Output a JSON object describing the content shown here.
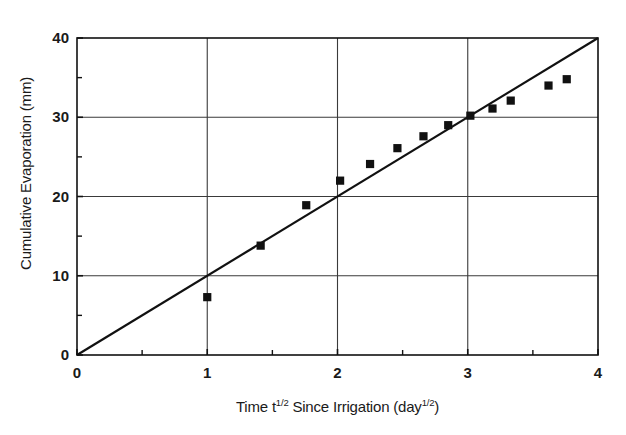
{
  "chart_data": {
    "type": "scatter",
    "title": "",
    "xlabel": "Time t^1/2 Since Irrigation (day^1/2)",
    "xlabel_parts": {
      "pre": "Time t",
      "sup1": "1/2",
      "mid": " Since Irrigation (day",
      "sup2": "1/2",
      "post": ")"
    },
    "ylabel": "Cumulative Evaporation (mm)",
    "xlim": [
      0,
      4
    ],
    "ylim": [
      0,
      40
    ],
    "x_major_ticks": [
      0,
      1,
      2,
      3,
      4
    ],
    "x_minor_ticks": [
      0.5,
      1.5,
      2.5,
      3.5
    ],
    "x_tick_labels": [
      "0",
      "1",
      "2",
      "3",
      "4"
    ],
    "y_major_ticks": [
      0,
      10,
      20,
      30,
      40
    ],
    "y_minor_ticks": [
      5,
      15,
      25,
      35
    ],
    "y_tick_labels": [
      "0",
      "10",
      "20",
      "30",
      "40"
    ],
    "grid": true,
    "grid_color": "#3a3a3a",
    "legend": "none",
    "marker": "filled-square",
    "marker_color": "#111111",
    "series": [
      {
        "name": "Measured cumulative evaporation",
        "type": "scatter",
        "points": [
          {
            "x": 1.0,
            "y": 7.3
          },
          {
            "x": 1.41,
            "y": 13.8
          },
          {
            "x": 1.76,
            "y": 18.9
          },
          {
            "x": 2.02,
            "y": 22.0
          },
          {
            "x": 2.25,
            "y": 24.1
          },
          {
            "x": 2.46,
            "y": 26.1
          },
          {
            "x": 2.66,
            "y": 27.6
          },
          {
            "x": 2.85,
            "y": 29.0
          },
          {
            "x": 3.02,
            "y": 30.2
          },
          {
            "x": 3.19,
            "y": 31.1
          },
          {
            "x": 3.33,
            "y": 32.1
          },
          {
            "x": 3.62,
            "y": 34.0
          },
          {
            "x": 3.76,
            "y": 34.8
          }
        ]
      },
      {
        "name": "Fitted line",
        "type": "line",
        "slope": 10.0,
        "intercept": 0.0,
        "points": [
          {
            "x": 0.0,
            "y": 0.0
          },
          {
            "x": 4.0,
            "y": 40.0
          }
        ]
      }
    ]
  }
}
